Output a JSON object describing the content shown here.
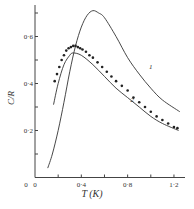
{
  "chart_data": {
    "type": "line",
    "title": "",
    "xlabel": "T  (K)",
    "ylabel": "C/R",
    "xlim": [
      0,
      1.3
    ],
    "ylim": [
      0,
      0.75
    ],
    "x_ticks": [
      0,
      0.2,
      0.4,
      0.6,
      0.8,
      1.0,
      1.2
    ],
    "x_tick_labels": [
      "0",
      "",
      "0·4",
      "",
      "0·8",
      "",
      "1·2"
    ],
    "y_ticks": [
      0,
      0.1,
      0.2,
      0.3,
      0.4,
      0.5,
      0.6,
      0.7
    ],
    "y_tick_labels": [
      "",
      "",
      "0·2",
      "",
      "0·4",
      "",
      "0·6",
      ""
    ],
    "grid": false,
    "legend": "inline curve labels",
    "series": [
      {
        "name": "1",
        "style": "line",
        "x": [
          0.11,
          0.15,
          0.2,
          0.25,
          0.3,
          0.35,
          0.4,
          0.45,
          0.5,
          0.55,
          0.6,
          0.7,
          0.8,
          0.9,
          1.0,
          1.1,
          1.25
        ],
        "y": [
          0.04,
          0.1,
          0.2,
          0.32,
          0.45,
          0.56,
          0.64,
          0.69,
          0.71,
          0.7,
          0.68,
          0.6,
          0.51,
          0.44,
          0.38,
          0.33,
          0.28
        ]
      },
      {
        "name": "2",
        "style": "line",
        "x": [
          0.16,
          0.2,
          0.25,
          0.3,
          0.33,
          0.4,
          0.5,
          0.6,
          0.7,
          0.8,
          0.9,
          1.0,
          1.1,
          1.24
        ],
        "y": [
          0.31,
          0.4,
          0.48,
          0.52,
          0.53,
          0.52,
          0.48,
          0.43,
          0.38,
          0.34,
          0.3,
          0.26,
          0.23,
          0.2
        ]
      },
      {
        "name": "experimental",
        "style": "markers",
        "x": [
          0.17,
          0.19,
          0.21,
          0.23,
          0.25,
          0.27,
          0.29,
          0.31,
          0.33,
          0.35,
          0.37,
          0.39,
          0.41,
          0.44,
          0.47,
          0.5,
          0.54,
          0.58,
          0.62,
          0.66,
          0.7,
          0.75,
          0.8,
          0.85,
          0.9,
          0.95,
          1.0,
          1.05,
          1.1,
          1.15,
          1.2,
          1.23
        ],
        "y": [
          0.41,
          0.44,
          0.47,
          0.5,
          0.52,
          0.54,
          0.55,
          0.555,
          0.56,
          0.56,
          0.555,
          0.55,
          0.545,
          0.535,
          0.52,
          0.51,
          0.49,
          0.47,
          0.45,
          0.43,
          0.41,
          0.39,
          0.37,
          0.34,
          0.32,
          0.3,
          0.28,
          0.26,
          0.245,
          0.23,
          0.215,
          0.21
        ]
      }
    ],
    "annotations": [
      {
        "text": "1",
        "x": 1.0,
        "y": 0.46
      },
      {
        "text": "2",
        "x": 0.84,
        "y": 0.32
      }
    ]
  }
}
